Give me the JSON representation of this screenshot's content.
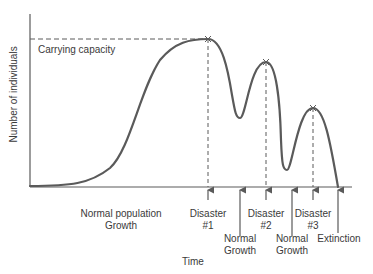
{
  "diagram": {
    "y_axis_label": "Number of individuals",
    "x_axis_label": "Time",
    "carrying_capacity_label": "Carrying capacity",
    "annotations": {
      "normal_population": "Normal population",
      "normal_population_line2": "Growth",
      "disaster1": "Disaster",
      "disaster1_num": "#1",
      "normal_growth1": "Normal",
      "normal_growth1_line2": "Growth",
      "disaster2": "Disaster",
      "disaster2_num": "#2",
      "normal_growth2": "Normal",
      "normal_growth2_line2": "Growth",
      "disaster3": "Disaster",
      "disaster3_num": "#3",
      "extinction": "Extinction"
    },
    "colors": {
      "curve": "#5a5a5a",
      "axis": "#5a5a5a",
      "text": "#3a3a3a"
    }
  }
}
